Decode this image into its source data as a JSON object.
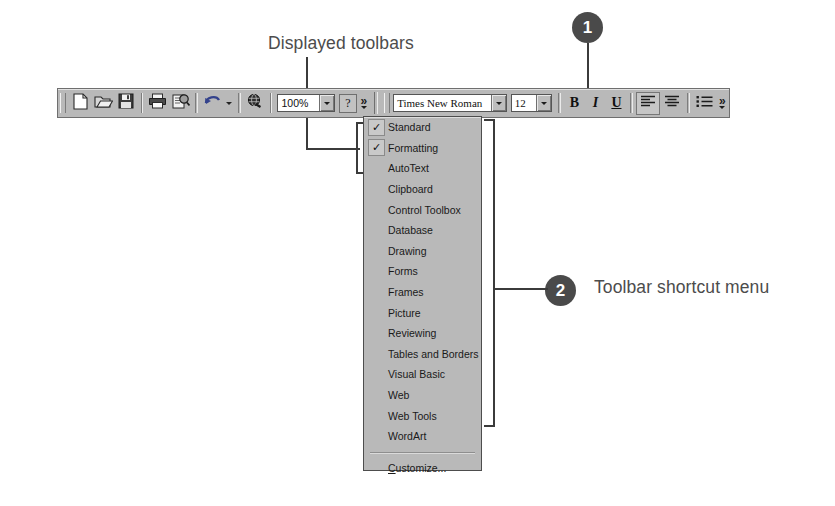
{
  "callouts": [
    {
      "number": "1",
      "label": "Displayed toolbars"
    },
    {
      "number": "2",
      "label": "Toolbar shortcut menu"
    }
  ],
  "labels": {
    "displayed_toolbars": "Displayed toolbars",
    "toolbar_shortcut_menu": "Toolbar shortcut menu",
    "badge_one": "1",
    "badge_two": "2"
  },
  "toolbar": {
    "standard_buttons": [
      {
        "name": "new-document",
        "icon": "page-icon"
      },
      {
        "name": "open",
        "icon": "folder-open-icon"
      },
      {
        "name": "save",
        "icon": "floppy-disk-icon"
      },
      {
        "name": "print",
        "icon": "printer-icon"
      },
      {
        "name": "print-preview",
        "icon": "print-preview-icon"
      },
      {
        "name": "undo",
        "icon": "undo-arrow-icon"
      },
      {
        "name": "insert-hyperlink",
        "icon": "globe-link-icon"
      }
    ],
    "zoom": {
      "value": "100%",
      "name": "zoom-combo"
    },
    "help": {
      "label": "?",
      "name": "help-button"
    },
    "overflow_label": "»",
    "font_name": {
      "value": "Times New Roman",
      "name": "font-name-combo"
    },
    "font_size": {
      "value": "12",
      "name": "font-size-combo"
    },
    "bold": "B",
    "italic": "I",
    "underline": "U",
    "align_left": "align-left-icon",
    "align_center": "align-center-icon",
    "bullets": "bullet-list-icon"
  },
  "menu": {
    "items": [
      {
        "label": "Standard",
        "checked": true
      },
      {
        "label": "Formatting",
        "checked": true
      },
      {
        "label": "AutoText",
        "checked": false
      },
      {
        "label": "Clipboard",
        "checked": false
      },
      {
        "label": "Control Toolbox",
        "checked": false
      },
      {
        "label": "Database",
        "checked": false
      },
      {
        "label": "Drawing",
        "checked": false
      },
      {
        "label": "Forms",
        "checked": false
      },
      {
        "label": "Frames",
        "checked": false
      },
      {
        "label": "Picture",
        "checked": false
      },
      {
        "label": "Reviewing",
        "checked": false
      },
      {
        "label": "Tables and Borders",
        "checked": false
      },
      {
        "label": "Visual Basic",
        "checked": false
      },
      {
        "label": "Web",
        "checked": false
      },
      {
        "label": "Web Tools",
        "checked": false
      },
      {
        "label": "WordArt",
        "checked": false
      }
    ],
    "check_glyph": "✓",
    "customize": {
      "prefix": "C",
      "rest": "ustomize..."
    }
  },
  "colors": {
    "background": "#ffffff",
    "toolbar_face": "#b9b9b9",
    "menu_face": "#b9b9b9",
    "badge": "#4a4a4a",
    "leader": "#3b3b3b",
    "label_text": "#4c4c4c"
  }
}
